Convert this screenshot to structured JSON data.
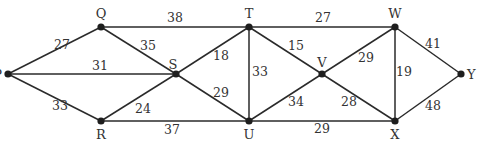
{
  "diagram": {
    "type": "weighted-graph",
    "nodes": [
      {
        "id": "P",
        "label": "P",
        "x": 8,
        "y": 74,
        "lx": -6,
        "ly": 5,
        "anchor": "end"
      },
      {
        "id": "Q",
        "label": "Q",
        "x": 101,
        "y": 27,
        "lx": 0,
        "ly": -9,
        "anchor": "middle"
      },
      {
        "id": "R",
        "label": "R",
        "x": 101,
        "y": 121,
        "lx": 0,
        "ly": 18,
        "anchor": "middle"
      },
      {
        "id": "S",
        "label": "S",
        "x": 176,
        "y": 74,
        "lx": -3,
        "ly": -5,
        "anchor": "middle"
      },
      {
        "id": "T",
        "label": "T",
        "x": 249,
        "y": 27,
        "lx": 0,
        "ly": -9,
        "anchor": "middle"
      },
      {
        "id": "U",
        "label": "U",
        "x": 249,
        "y": 121,
        "lx": 0,
        "ly": 18,
        "anchor": "middle"
      },
      {
        "id": "V",
        "label": "V",
        "x": 322,
        "y": 74,
        "lx": 0,
        "ly": -7,
        "anchor": "middle"
      },
      {
        "id": "W",
        "label": "W",
        "x": 395,
        "y": 27,
        "lx": 0,
        "ly": -9,
        "anchor": "middle"
      },
      {
        "id": "X",
        "label": "X",
        "x": 395,
        "y": 121,
        "lx": 0,
        "ly": 18,
        "anchor": "middle"
      },
      {
        "id": "Y",
        "label": "Y",
        "x": 461,
        "y": 74,
        "lx": 6,
        "ly": 5,
        "anchor": "start"
      }
    ],
    "edges": [
      {
        "from": "P",
        "to": "Q",
        "weight": "27",
        "wx": 62,
        "wy": 49
      },
      {
        "from": "P",
        "to": "S",
        "weight": "31",
        "wx": 100,
        "wy": 70
      },
      {
        "from": "P",
        "to": "R",
        "weight": "33",
        "wx": 60,
        "wy": 110
      },
      {
        "from": "Q",
        "to": "S",
        "weight": "35",
        "wx": 148,
        "wy": 50
      },
      {
        "from": "Q",
        "to": "T",
        "weight": "38",
        "wx": 175,
        "wy": 22
      },
      {
        "from": "R",
        "to": "S",
        "weight": "24",
        "wx": 143,
        "wy": 113
      },
      {
        "from": "R",
        "to": "U",
        "weight": "37",
        "wx": 172,
        "wy": 134
      },
      {
        "from": "S",
        "to": "T",
        "weight": "18",
        "wx": 221,
        "wy": 60
      },
      {
        "from": "S",
        "to": "U",
        "weight": "29",
        "wx": 221,
        "wy": 97
      },
      {
        "from": "T",
        "to": "U",
        "weight": "33",
        "wx": 260,
        "wy": 76
      },
      {
        "from": "T",
        "to": "V",
        "weight": "15",
        "wx": 296,
        "wy": 50
      },
      {
        "from": "T",
        "to": "W",
        "weight": "27",
        "wx": 323,
        "wy": 22
      },
      {
        "from": "U",
        "to": "V",
        "weight": "34",
        "wx": 296,
        "wy": 106
      },
      {
        "from": "U",
        "to": "X",
        "weight": "29",
        "wx": 322,
        "wy": 133
      },
      {
        "from": "V",
        "to": "W",
        "weight": "29",
        "wx": 366,
        "wy": 62
      },
      {
        "from": "V",
        "to": "X",
        "weight": "28",
        "wx": 349,
        "wy": 106
      },
      {
        "from": "W",
        "to": "X",
        "weight": "19",
        "wx": 404,
        "wy": 76
      },
      {
        "from": "W",
        "to": "Y",
        "weight": "41",
        "wx": 433,
        "wy": 48
      },
      {
        "from": "X",
        "to": "Y",
        "weight": "48",
        "wx": 433,
        "wy": 110
      }
    ]
  }
}
